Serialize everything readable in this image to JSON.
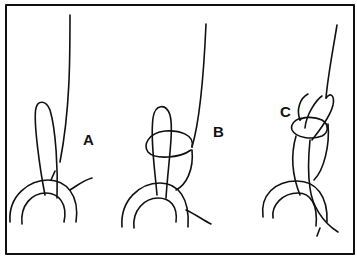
{
  "figure": {
    "type": "knot-tying-steps",
    "stroke_color": "#111111",
    "background": "#ffffff",
    "frame": {
      "x": 6,
      "y": 5,
      "width": 348,
      "height": 249
    },
    "panels": [
      {
        "id": "A",
        "label": "A",
        "description": "Line passed through ring forming long loop"
      },
      {
        "id": "B",
        "label": "B",
        "description": "Tag end wrapped around both strands of loop"
      },
      {
        "id": "C",
        "label": "C",
        "description": "Loop folded over and knot drawn tight"
      }
    ]
  }
}
